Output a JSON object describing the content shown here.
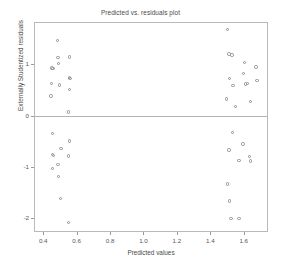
{
  "chart_data": {
    "type": "scatter",
    "title": "Predicted vs. residuals plot",
    "xlabel": "Predicted values",
    "ylabel": "Externally Studentized residuals",
    "xlim": [
      0.345,
      1.745
    ],
    "ylim": [
      -2.28,
      1.83
    ],
    "grid": false,
    "legend": null,
    "marker": "open-circle",
    "marker_color": "#8f8f8f",
    "reference_lines": [
      {
        "axis": "y",
        "value": 0,
        "color": "#b4b4b4"
      }
    ],
    "xticks": [
      0.4,
      0.6,
      0.8,
      1.0,
      1.2,
      1.4,
      1.6
    ],
    "xticklabels": [
      "0.4",
      "0.6",
      "0.8",
      "1.0",
      "1.2",
      "1.4",
      "1.6"
    ],
    "yticks": [
      1,
      0,
      -1,
      -2
    ],
    "yticklabels": [
      "1",
      "0",
      "-1",
      "-2"
    ],
    "points": [
      {
        "x": 0.452,
        "y": 0.933
      },
      {
        "x": 0.458,
        "y": 0.925
      },
      {
        "x": 0.449,
        "y": 0.627
      },
      {
        "x": 0.447,
        "y": 0.383
      },
      {
        "x": 0.487,
        "y": 1.468
      },
      {
        "x": 0.489,
        "y": 1.132
      },
      {
        "x": 0.493,
        "y": 1.019
      },
      {
        "x": 0.497,
        "y": 0.597
      },
      {
        "x": 0.556,
        "y": 1.143
      },
      {
        "x": 0.556,
        "y": 0.742
      },
      {
        "x": 0.56,
        "y": 0.73
      },
      {
        "x": 0.558,
        "y": 0.505
      },
      {
        "x": 0.551,
        "y": 0.072
      },
      {
        "x": 0.454,
        "y": -0.353
      },
      {
        "x": 0.456,
        "y": -0.76
      },
      {
        "x": 0.461,
        "y": -0.783
      },
      {
        "x": 0.455,
        "y": -1.043
      },
      {
        "x": 0.489,
        "y": -0.953
      },
      {
        "x": 0.492,
        "y": -1.198
      },
      {
        "x": 0.506,
        "y": -0.643
      },
      {
        "x": 0.503,
        "y": -1.63
      },
      {
        "x": 0.556,
        "y": -0.5
      },
      {
        "x": 0.553,
        "y": -0.793
      },
      {
        "x": 0.552,
        "y": -2.093
      },
      {
        "x": 1.504,
        "y": 1.688
      },
      {
        "x": 1.511,
        "y": 1.206
      },
      {
        "x": 1.53,
        "y": 1.184
      },
      {
        "x": 1.513,
        "y": 0.726
      },
      {
        "x": 1.536,
        "y": 0.586
      },
      {
        "x": 1.498,
        "y": 0.323
      },
      {
        "x": 1.551,
        "y": 0.173
      },
      {
        "x": 1.604,
        "y": 1.035
      },
      {
        "x": 1.6,
        "y": 0.82
      },
      {
        "x": 1.612,
        "y": 0.614
      },
      {
        "x": 1.621,
        "y": 0.624
      },
      {
        "x": 1.639,
        "y": 0.272
      },
      {
        "x": 1.672,
        "y": 0.952
      },
      {
        "x": 1.68,
        "y": 0.682
      },
      {
        "x": 1.534,
        "y": -0.33
      },
      {
        "x": 1.511,
        "y": -0.673
      },
      {
        "x": 1.596,
        "y": -0.558
      },
      {
        "x": 1.572,
        "y": -0.885
      },
      {
        "x": 1.634,
        "y": -0.797
      },
      {
        "x": 1.641,
        "y": -0.892
      },
      {
        "x": 1.503,
        "y": -1.337
      },
      {
        "x": 1.513,
        "y": -1.672
      },
      {
        "x": 1.523,
        "y": -2.012
      },
      {
        "x": 1.572,
        "y": -2.01
      }
    ]
  }
}
